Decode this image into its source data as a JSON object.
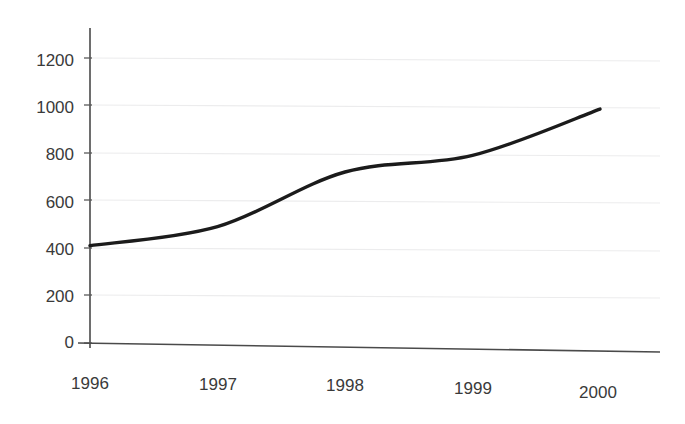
{
  "chart_data": {
    "type": "line",
    "title": "",
    "subtitle": "",
    "xlabel": "",
    "ylabel": "",
    "categories": [
      "1996",
      "1997",
      "1998",
      "1999",
      "2000"
    ],
    "x": [
      1996,
      1997,
      1998,
      1999,
      2000
    ],
    "values": [
      410,
      490,
      720,
      790,
      985
    ],
    "series": [
      {
        "name": "",
        "values": [
          410,
          490,
          720,
          790,
          985
        ],
        "color": "#1b1b1b",
        "line_style": "solid",
        "smoothing": "spline",
        "markers": "none"
      }
    ],
    "ylim": [
      0,
      1300
    ],
    "xlim": [
      1996,
      2000
    ],
    "ytick_labels": [
      "0",
      "200",
      "400",
      "600",
      "800",
      "1000",
      "1200"
    ],
    "ytick_values": [
      0,
      200,
      400,
      600,
      800,
      1000,
      1200
    ],
    "xtick_labels": [
      "1996",
      "1997",
      "1998",
      "1999",
      "2000"
    ],
    "grid": "horizontal",
    "grid_color": "#ececed",
    "legend": "none",
    "legend_position": "none",
    "axis_color": "#4a4a4a",
    "background": "#ffffff",
    "annotations": []
  },
  "axes": {
    "y": {
      "ticks": [
        {
          "label": "1200",
          "value": 1200
        },
        {
          "label": "1000",
          "value": 1000
        },
        {
          "label": "800",
          "value": 800
        },
        {
          "label": "600",
          "value": 600
        },
        {
          "label": "400",
          "value": 400
        },
        {
          "label": "200",
          "value": 200
        },
        {
          "label": "0",
          "value": 0
        }
      ]
    },
    "x": {
      "ticks": [
        {
          "label": "1996",
          "value": 1996
        },
        {
          "label": "1997",
          "value": 1997
        },
        {
          "label": "1998",
          "value": 1998
        },
        {
          "label": "1999",
          "value": 1999
        },
        {
          "label": "2000",
          "value": 2000
        }
      ]
    }
  }
}
